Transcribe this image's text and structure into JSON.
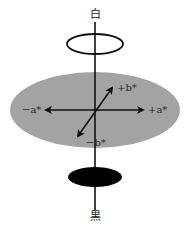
{
  "diagram": {
    "labels": {
      "white": "白",
      "black": "黒",
      "plus_a": "+a*",
      "minus_a": "−a*",
      "plus_b": "+b*",
      "minus_b": "−b*"
    },
    "colors": {
      "background": "#ffffff",
      "plane_fill": "#a3a3a3",
      "axis_stroke": "#111111",
      "white_disk_fill": "#ffffff",
      "black_disk_fill": "#000000"
    }
  }
}
